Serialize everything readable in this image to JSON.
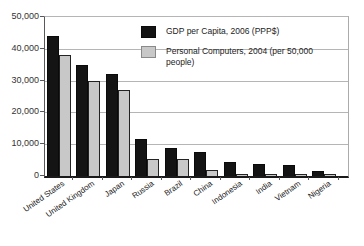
{
  "chart_data": {
    "type": "bar",
    "title": "",
    "xlabel": "",
    "ylabel": "",
    "categories": [
      "United States",
      "United Kingdom",
      "Japan",
      "Russia",
      "Brazil",
      "China",
      "Indonesia",
      "India",
      "Vietnam",
      "Nigeria"
    ],
    "series": [
      {
        "name": "GDP per Capita, 2006 (PPP$)",
        "color": "#141414",
        "values": [
          44000,
          35000,
          32000,
          11500,
          8800,
          7600,
          4300,
          3700,
          3400,
          1500
        ]
      },
      {
        "name": "Personal Computers, 2004 (per 50,000 people)",
        "color": "#c8c8c8",
        "values": [
          38000,
          30000,
          27000,
          5200,
          5400,
          2000,
          700,
          600,
          650,
          350
        ]
      }
    ],
    "ylim": [
      0,
      50000
    ],
    "yticks": [
      0,
      10000,
      20000,
      30000,
      40000,
      50000
    ],
    "ytick_labels": [
      "0",
      "10,000",
      "20,000",
      "30,000",
      "40,000",
      "50,000"
    ],
    "grid": true,
    "legend_position": "inside-upper-right"
  }
}
